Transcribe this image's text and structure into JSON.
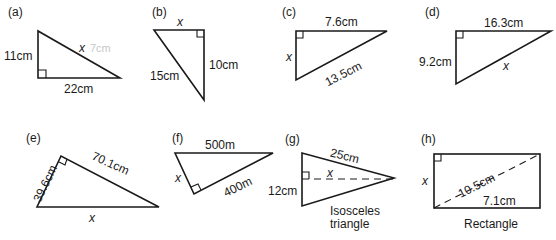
{
  "figures": [
    {
      "id": "a",
      "label": "(a)",
      "shape": "right triangle",
      "sides": {
        "vertical": "11cm",
        "horizontal": "22cm",
        "hypotenuse": "x"
      },
      "pencil_note": "7cm"
    },
    {
      "id": "b",
      "label": "(b)",
      "shape": "right triangle",
      "sides": {
        "top": "x",
        "vertical": "10cm",
        "hypotenuse": "15cm"
      }
    },
    {
      "id": "c",
      "label": "(c)",
      "shape": "right triangle",
      "sides": {
        "top": "7.6cm",
        "vertical": "x",
        "hypotenuse": "13.5cm"
      }
    },
    {
      "id": "d",
      "label": "(d)",
      "shape": "right triangle",
      "sides": {
        "top": "16.3cm",
        "vertical": "9.2cm",
        "hypotenuse": "x"
      }
    },
    {
      "id": "e",
      "label": "(e)",
      "shape": "right triangle",
      "sides": {
        "left": "39.6cm",
        "right": "70.1cm",
        "base": "x"
      }
    },
    {
      "id": "f",
      "label": "(f)",
      "shape": "right triangle",
      "sides": {
        "top": "500m",
        "left": "x",
        "right": "400m"
      }
    },
    {
      "id": "g",
      "label": "(g)",
      "shape": "isosceles triangle",
      "sides": {
        "slant": "25cm",
        "base": "12cm",
        "height": "x"
      },
      "caption_line1": "Isosceles",
      "caption_line2": "triangle"
    },
    {
      "id": "h",
      "label": "(h)",
      "shape": "rectangle",
      "sides": {
        "height": "x",
        "diagonal": "10.5cm",
        "width": "7.1cm"
      },
      "caption": "Rectangle"
    }
  ],
  "colors": {
    "ink": "#1a1a1a",
    "pencil": "#c8c8c8",
    "background": "#ffffff"
  }
}
